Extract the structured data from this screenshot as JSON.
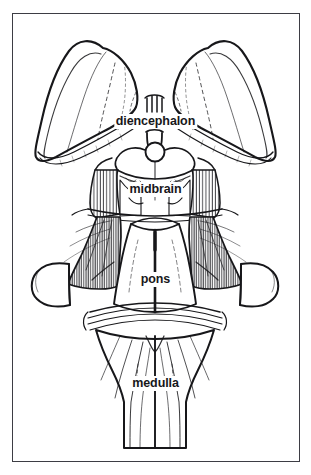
{
  "figure": {
    "type": "anatomical-line-drawing",
    "background_color": "#ffffff",
    "ink_color": "#17171a",
    "frame": {
      "border_color": "#3d3d44",
      "border_width_px": 1.5,
      "x": 12,
      "y": 13,
      "width": 288,
      "height": 449
    }
  },
  "labels": {
    "diencephalon": "diencephalon",
    "midbrain": "midbrain",
    "pons": "pons",
    "medulla": "medulla"
  },
  "structures": [
    {
      "name": "diencephalon",
      "label": "diencephalon",
      "description": "paired thalamic masses forming the two large wing-shaped lobes at the top of the figure",
      "label_x": 155,
      "label_y": 120
    },
    {
      "name": "midbrain",
      "label": "midbrain",
      "description": "region containing the superior and inferior colliculi below the pineal body",
      "label_x": 155,
      "label_y": 188
    },
    {
      "name": "pons",
      "label": "pons",
      "description": "central bulge with a dark median sulcus, flanked by striated cerebellar peduncles",
      "label_x": 155,
      "label_y": 278
    },
    {
      "name": "medulla",
      "label": "medulla",
      "description": "tapering lower segment with longitudinal fiber striations continuing to the spinal cord",
      "label_x": 155,
      "label_y": 382
    }
  ]
}
